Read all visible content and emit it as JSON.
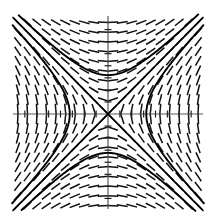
{
  "figure": {
    "title": "",
    "caption": "",
    "background_color": "#ffffff",
    "width": 215,
    "height": 223
  },
  "chart_data": {
    "type": "line",
    "title": "",
    "subtitle": "",
    "xlabel": "",
    "ylabel": "",
    "plot_kind": "slope-field-with-solution-curves",
    "equation": "dy/dx = x/y",
    "xlim": [
      -4,
      4
    ],
    "ylim": [
      -4,
      4
    ],
    "grid": false,
    "legend": "none",
    "axes": {
      "x_axis_visible": true,
      "y_axis_visible": true,
      "axis_color": "#5a5a5a",
      "tick_color": "#222222",
      "x_ticks": [
        -3.5,
        -3,
        -2.5,
        -2,
        -1.5,
        -1,
        -0.5,
        0.5,
        1,
        1.5,
        2,
        2.5,
        3,
        3.5
      ],
      "y_ticks": [
        -3.5,
        -3,
        -2.5,
        -2,
        -1.5,
        -1,
        -0.5,
        0.5,
        1,
        1.5,
        2,
        2.5,
        3,
        3.5
      ],
      "tick_length_px": 7,
      "tick_labels_shown": false
    },
    "slope_field": {
      "color": "#111111",
      "segment_length_px": 11,
      "line_width_px": 1.5,
      "grid_spacing_units": 0.4,
      "grid_x_start": -3.8,
      "grid_x_end": 3.8,
      "grid_y_start": -3.8,
      "grid_y_end": 3.8,
      "slope_formula": "x/y",
      "description": "Short line segments whose slope equals x divided by y; near-vertical along the y=0 line and near-horizontal along the x=0 line."
    },
    "solution_curves": {
      "color": "#000000",
      "line_width_px": 1.9,
      "family": "y^2 - x^2 = c",
      "branches": [
        {
          "name": "upper-hyperbola",
          "c": 2.6,
          "vertex": [
            0,
            1.61
          ],
          "opens": "up"
        },
        {
          "name": "lower-hyperbola",
          "c": 2.6,
          "vertex": [
            0,
            -1.61
          ],
          "opens": "down"
        },
        {
          "name": "right-hyperbola",
          "c": -2.6,
          "vertex": [
            1.61,
            0
          ],
          "opens": "right"
        },
        {
          "name": "left-hyperbola",
          "c": -2.6,
          "vertex": [
            -1.61,
            0
          ],
          "opens": "left"
        },
        {
          "name": "asymptote-positive",
          "c": 0,
          "line": "y = x"
        },
        {
          "name": "asymptote-negative",
          "c": 0,
          "line": "y = -x"
        }
      ]
    }
  }
}
